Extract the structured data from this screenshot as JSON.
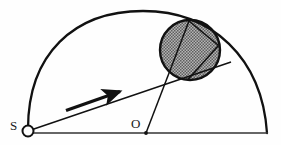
{
  "figure": {
    "background_color": "#fefefe",
    "stroke_color": "#1a1a1a",
    "shaded_fill_color": "#999999",
    "width": 281,
    "height": 145
  },
  "labels": {
    "source_point": "S",
    "origin_point": "O"
  },
  "elements": {
    "arc_name": "semicircular-arc",
    "baseline_name": "horizontal-baseline",
    "shaded_circle_name": "shaded-circle",
    "arrow_name": "direction-arrow",
    "source_marker_name": "source-open-circle",
    "origin_marker_name": "origin-dot",
    "ray_from_source_name": "ray-from-source",
    "ray_from_origin_name": "ray-from-origin",
    "chord_upper_name": "chord-upper",
    "chord_lower_name": "chord-lower"
  },
  "geometry": {
    "source": {
      "x": 28,
      "y": 131
    },
    "origin": {
      "x": 146,
      "y": 133
    },
    "baseline": {
      "x1": 28,
      "y1": 133,
      "x2": 268,
      "y2": 133
    },
    "arc": {
      "start_x": 28,
      "start_y": 129,
      "end_x": 267,
      "end_y": 133,
      "apex_x": 143,
      "apex_y": 11
    },
    "shaded_circle": {
      "cx": 190,
      "cy": 50,
      "r": 30
    },
    "arrow": {
      "x1": 66,
      "y1": 110,
      "x2": 124,
      "y2": 90
    },
    "ray_from_source": {
      "x1": 28,
      "y1": 131,
      "x2": 231,
      "y2": 62
    },
    "ray_from_origin": {
      "x1": 146,
      "y1": 133,
      "x2": 189,
      "y2": 21
    },
    "chord_upper": {
      "x1": 189,
      "y1": 21,
      "x2": 218,
      "y2": 45
    },
    "chord_lower": {
      "x1": 218,
      "y1": 45,
      "x2": 188,
      "y2": 80
    },
    "source_marker": {
      "cx": 28,
      "cy": 131,
      "r": 5.5
    },
    "origin_marker": {
      "cx": 146,
      "cy": 133,
      "r": 1.8
    },
    "label_source_pos": {
      "x": 10,
      "y": 130
    },
    "label_origin_pos": {
      "x": 131,
      "y": 128
    }
  }
}
